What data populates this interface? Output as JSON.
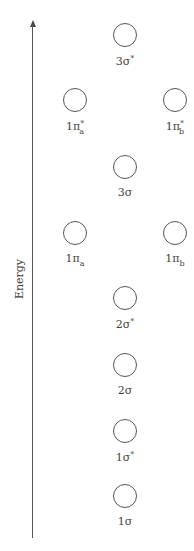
{
  "axis": {
    "label": "Energy",
    "direction": "up"
  },
  "orbitals": [
    {
      "id": "3sigma-star",
      "base": "3σ",
      "sub": "",
      "sup": "*",
      "x": 125,
      "y": 35
    },
    {
      "id": "1pi-a-star",
      "base": "1π",
      "sub": "a",
      "sup": "*",
      "x": 75,
      "y": 100
    },
    {
      "id": "1pi-b-star",
      "base": "1π",
      "sub": "b",
      "sup": "*",
      "x": 175,
      "y": 100
    },
    {
      "id": "3sigma",
      "base": "3σ",
      "sub": "",
      "sup": "",
      "x": 125,
      "y": 167
    },
    {
      "id": "1pi-a",
      "base": "1π",
      "sub": "a",
      "sup": "",
      "x": 75,
      "y": 233
    },
    {
      "id": "1pi-b",
      "base": "1π",
      "sub": "b",
      "sup": "",
      "x": 175,
      "y": 233
    },
    {
      "id": "2sigma-star",
      "base": "2σ",
      "sub": "",
      "sup": "*",
      "x": 125,
      "y": 298
    },
    {
      "id": "2sigma",
      "base": "2σ",
      "sub": "",
      "sup": "",
      "x": 125,
      "y": 365
    },
    {
      "id": "1sigma-star",
      "base": "1σ",
      "sub": "",
      "sup": "*",
      "x": 125,
      "y": 431
    },
    {
      "id": "1sigma",
      "base": "1σ",
      "sub": "",
      "sup": "",
      "x": 125,
      "y": 496
    }
  ],
  "colors": {
    "stroke": "#555555",
    "text": "#444444",
    "background": "#ffffff"
  }
}
